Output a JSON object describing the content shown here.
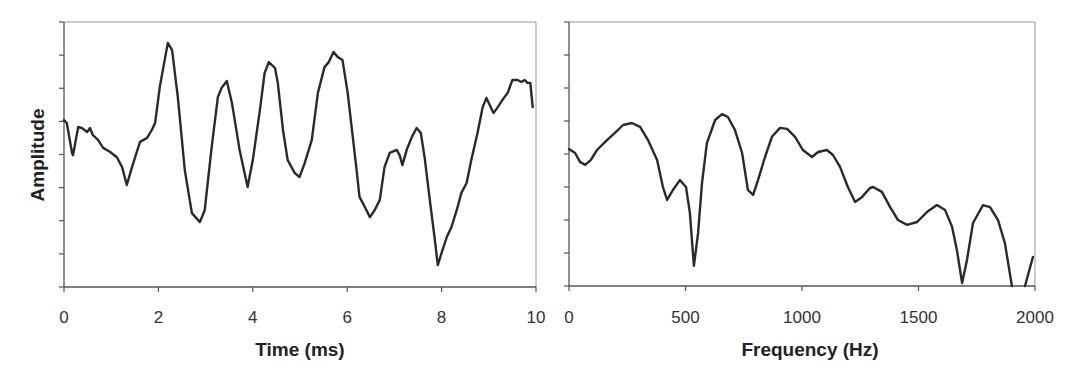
{
  "colors": {
    "curve": "#2a2a2a",
    "axis": "#555555",
    "frame": "#9a9a9a",
    "text": "#333333"
  },
  "chart_data": [
    {
      "type": "line",
      "title": "",
      "xlabel": "Time (ms)",
      "ylabel": "Amplitude",
      "xlim": [
        0,
        10
      ],
      "ylim": [
        0,
        8
      ],
      "x_ticks": [
        0,
        2,
        4,
        6,
        8,
        10
      ],
      "x_tick_labels": [
        "0",
        "2",
        "4",
        "6",
        "8",
        "10"
      ],
      "y_ticks": [
        0,
        1,
        2,
        3,
        4,
        5,
        6,
        7,
        8
      ],
      "y_tick_labels": [],
      "grid": false,
      "legend": null,
      "series": [
        {
          "name": "waveform",
          "x": [
            0.0,
            0.06,
            0.17,
            0.19,
            0.3,
            0.38,
            0.49,
            0.55,
            0.61,
            0.72,
            0.83,
            0.97,
            1.12,
            1.23,
            1.33,
            1.44,
            1.61,
            1.76,
            1.86,
            1.93,
            2.03,
            2.2,
            2.29,
            2.41,
            2.56,
            2.71,
            2.88,
            2.98,
            3.13,
            3.26,
            3.34,
            3.45,
            3.56,
            3.72,
            3.89,
            4.0,
            4.15,
            4.25,
            4.34,
            4.47,
            4.53,
            4.64,
            4.74,
            4.89,
            4.99,
            5.1,
            5.25,
            5.38,
            5.52,
            5.61,
            5.71,
            5.8,
            5.9,
            6.01,
            6.2,
            6.26,
            6.37,
            6.48,
            6.58,
            6.69,
            6.79,
            6.9,
            7.05,
            7.11,
            7.17,
            7.26,
            7.37,
            7.47,
            7.56,
            7.64,
            7.75,
            7.85,
            7.92,
            8.0,
            8.11,
            8.21,
            8.32,
            8.42,
            8.53,
            8.63,
            8.76,
            8.87,
            8.95,
            9.02,
            9.1,
            9.19,
            9.29,
            9.4,
            9.5,
            9.61,
            9.69,
            9.76,
            9.82,
            9.88,
            9.93
          ],
          "y": [
            5.04,
            4.95,
            4.05,
            3.98,
            4.83,
            4.8,
            4.68,
            4.8,
            4.59,
            4.44,
            4.2,
            4.08,
            3.92,
            3.62,
            3.08,
            3.62,
            4.38,
            4.5,
            4.74,
            4.95,
            6.04,
            7.37,
            7.15,
            5.74,
            3.53,
            2.23,
            1.96,
            2.32,
            4.23,
            5.74,
            6.01,
            6.22,
            5.55,
            4.14,
            3.02,
            3.83,
            5.34,
            6.46,
            6.79,
            6.61,
            6.16,
            4.74,
            3.83,
            3.44,
            3.32,
            3.74,
            4.44,
            5.86,
            6.64,
            6.79,
            7.09,
            6.94,
            6.85,
            5.86,
            3.53,
            2.72,
            2.42,
            2.11,
            2.32,
            2.63,
            3.62,
            4.05,
            4.14,
            3.98,
            3.68,
            4.14,
            4.53,
            4.8,
            4.65,
            3.92,
            2.63,
            1.51,
            0.66,
            1.03,
            1.51,
            1.81,
            2.32,
            2.84,
            3.14,
            3.83,
            4.65,
            5.43,
            5.71,
            5.49,
            5.25,
            5.43,
            5.65,
            5.86,
            6.25,
            6.25,
            6.19,
            6.25,
            6.16,
            6.16,
            5.43
          ]
        }
      ]
    },
    {
      "type": "line",
      "title": "",
      "xlabel": "Frequency (Hz)",
      "ylabel": "",
      "xlim": [
        0,
        2000
      ],
      "ylim": [
        0,
        8
      ],
      "x_ticks": [
        0,
        500,
        1000,
        1500,
        2000
      ],
      "x_tick_labels": [
        "0",
        "500",
        "1000",
        "1500",
        "2000"
      ],
      "y_ticks": [
        0,
        1,
        2,
        3,
        4,
        5,
        6,
        7,
        8
      ],
      "y_tick_labels": [],
      "grid": false,
      "legend": null,
      "series": [
        {
          "name": "spectrum",
          "x": [
            0,
            26,
            47,
            69,
            94,
            120,
            163,
            197,
            232,
            270,
            305,
            339,
            378,
            403,
            421,
            446,
            476,
            502,
            519,
            536,
            554,
            571,
            592,
            627,
            657,
            682,
            712,
            743,
            768,
            790,
            811,
            841,
            871,
            906,
            936,
            970,
            1004,
            1043,
            1069,
            1107,
            1133,
            1163,
            1197,
            1228,
            1258,
            1292,
            1305,
            1343,
            1378,
            1412,
            1451,
            1494,
            1536,
            1579,
            1614,
            1644,
            1665,
            1687,
            1708,
            1734,
            1777,
            1807,
            1841,
            1871,
            1901,
            1957,
            1991
          ],
          "y": [
            4.15,
            4.03,
            3.76,
            3.67,
            3.82,
            4.12,
            4.42,
            4.64,
            4.88,
            4.94,
            4.82,
            4.42,
            3.82,
            3.0,
            2.61,
            2.91,
            3.21,
            3.0,
            2.21,
            0.61,
            1.61,
            3.12,
            4.33,
            5.03,
            5.21,
            5.12,
            4.73,
            4.03,
            2.91,
            2.76,
            3.21,
            3.91,
            4.52,
            4.79,
            4.76,
            4.52,
            4.12,
            3.91,
            4.06,
            4.12,
            3.97,
            3.61,
            3.0,
            2.55,
            2.7,
            2.97,
            3.0,
            2.85,
            2.39,
            2.0,
            1.85,
            1.94,
            2.24,
            2.45,
            2.3,
            1.79,
            1.09,
            0.09,
            0.79,
            1.91,
            2.45,
            2.39,
            2.0,
            1.3,
            0.0,
            0.0,
            0.88
          ],
          "breaks_after_index": [
            64
          ]
        }
      ]
    }
  ]
}
